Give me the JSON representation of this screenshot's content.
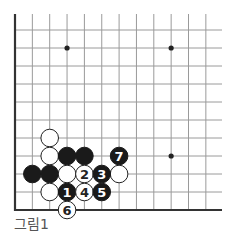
{
  "diagram": {
    "caption": "그림1",
    "type": "go-board-partial",
    "visible_corner": "bottom-left",
    "grid": {
      "columns": 12,
      "rows": 11,
      "origin_x": 15,
      "origin_y": 210,
      "dx": 17.35,
      "dy": 18,
      "right_extent": 222,
      "top_extent": 14
    },
    "colors": {
      "line": "#9a9a9a",
      "edge": "#333333",
      "black_stone": "#1a1a1a",
      "white_stone": "#ffffff",
      "white_outline": "#222222"
    },
    "star_points": [
      {
        "col": 3,
        "row": 9
      },
      {
        "col": 9,
        "row": 9
      },
      {
        "col": 9,
        "row": 3
      }
    ],
    "stones": [
      {
        "color": "white",
        "col": 2,
        "row": 4,
        "label": ""
      },
      {
        "color": "white",
        "col": 2,
        "row": 3,
        "label": ""
      },
      {
        "color": "black",
        "col": 3,
        "row": 3,
        "label": ""
      },
      {
        "color": "black",
        "col": 4,
        "row": 3,
        "label": ""
      },
      {
        "color": "black",
        "col": 1,
        "row": 2,
        "label": ""
      },
      {
        "color": "black",
        "col": 2,
        "row": 2,
        "label": ""
      },
      {
        "color": "white",
        "col": 3,
        "row": 2,
        "label": ""
      },
      {
        "color": "white",
        "col": 6,
        "row": 2,
        "label": ""
      },
      {
        "color": "white",
        "col": 2,
        "row": 1,
        "label": ""
      },
      {
        "color": "black",
        "col": 3,
        "row": 1,
        "label": "1"
      },
      {
        "color": "white",
        "col": 4,
        "row": 2,
        "label": "2"
      },
      {
        "color": "black",
        "col": 5,
        "row": 2,
        "label": "3"
      },
      {
        "color": "white",
        "col": 4,
        "row": 1,
        "label": "4"
      },
      {
        "color": "black",
        "col": 5,
        "row": 1,
        "label": "5"
      },
      {
        "color": "white",
        "col": 3,
        "row": 0,
        "label": "6"
      },
      {
        "color": "black",
        "col": 6,
        "row": 3,
        "label": "7"
      }
    ]
  }
}
